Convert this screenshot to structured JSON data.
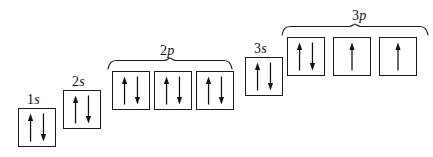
{
  "diagram": {
    "element_configuration": "1s2 2s2 2p6 3s2 3p4",
    "background_color": "#ffffff",
    "line_color": "#1a1a1a",
    "arrow_color": "#111111",
    "box_width": 38,
    "box_height": 39
  },
  "subshells": [
    {
      "id": "1s",
      "label_number": "1",
      "label_letter": "s",
      "label_x": 27,
      "label_y": 93,
      "box_top": 108,
      "box_left": 18,
      "box_count": 1,
      "box_gap": 4,
      "has_brace": false,
      "boxes": [
        {
          "name": "1s",
          "spins": [
            "up",
            "down"
          ]
        }
      ]
    },
    {
      "id": "2s",
      "label_number": "2",
      "label_letter": "s",
      "label_x": 72,
      "label_y": 75,
      "box_top": 90,
      "box_left": 63,
      "box_count": 1,
      "box_gap": 4,
      "has_brace": false,
      "boxes": [
        {
          "name": "2s",
          "spins": [
            "up",
            "down"
          ]
        }
      ]
    },
    {
      "id": "2p",
      "label_number": "2",
      "label_letter": "p",
      "label_x": 160,
      "label_y": 44,
      "box_top": 71,
      "box_left": 112,
      "box_count": 3,
      "box_gap": 4,
      "has_brace": true,
      "brace_left": 108,
      "brace_top": 58,
      "brace_width": 124,
      "boxes": [
        {
          "name": "2px",
          "spins": [
            "up",
            "down"
          ]
        },
        {
          "name": "2py",
          "spins": [
            "up",
            "down"
          ]
        },
        {
          "name": "2pz",
          "spins": [
            "up",
            "down"
          ]
        }
      ]
    },
    {
      "id": "3s",
      "label_number": "3",
      "label_letter": "s",
      "label_x": 254,
      "label_y": 42,
      "box_top": 57,
      "box_left": 245,
      "box_count": 1,
      "box_gap": 4,
      "has_brace": false,
      "boxes": [
        {
          "name": "3s",
          "spins": [
            "up",
            "down"
          ]
        }
      ]
    },
    {
      "id": "3p",
      "label_number": "3",
      "label_letter": "p",
      "label_x": 352,
      "label_y": 9,
      "box_top": 37,
      "box_left": 287,
      "box_count": 3,
      "box_gap": 8,
      "has_brace": true,
      "brace_left": 282,
      "brace_top": 24,
      "brace_width": 146,
      "boxes": [
        {
          "name": "3px",
          "spins": [
            "up",
            "down"
          ]
        },
        {
          "name": "3py",
          "spins": [
            "up"
          ]
        },
        {
          "name": "3pz",
          "spins": [
            "up"
          ]
        }
      ]
    }
  ]
}
